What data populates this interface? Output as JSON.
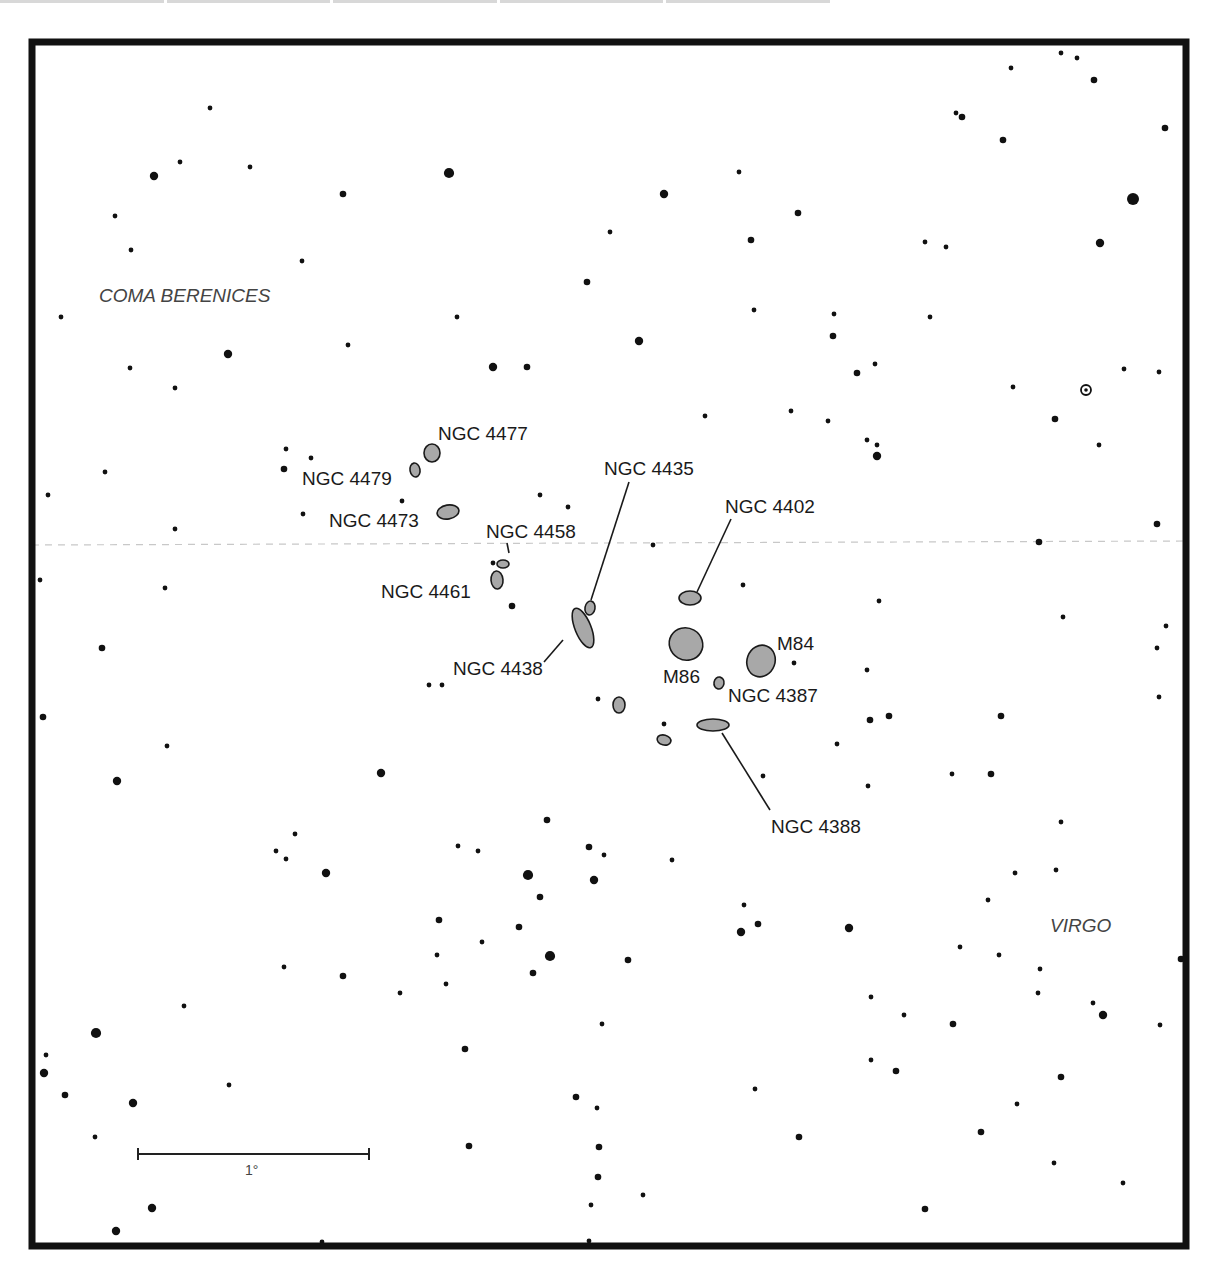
{
  "map": {
    "frame": {
      "x": 32,
      "y": 42,
      "w": 1154,
      "h": 1204,
      "stroke": 7,
      "color": "#111111"
    },
    "colors": {
      "galaxy_fill": "#a8a8a8",
      "galaxy_stroke": "#1a1a1a",
      "star": "#111111",
      "grid": "#c8c8c8"
    },
    "equator_line": {
      "y_left": 545,
      "y_right": 541
    },
    "constellations": [
      {
        "name": "COMA BERENICES",
        "x": 99,
        "y": 302
      },
      {
        "name": "VIRGO",
        "x": 1050,
        "y": 932
      }
    ],
    "galaxies": [
      {
        "id": "NGC 4477",
        "cx": 432,
        "cy": 453,
        "rx": 8,
        "ry": 9,
        "rot": 0,
        "label": "NGC 4477",
        "lx": 438,
        "ly": 440,
        "leader": null
      },
      {
        "id": "NGC 4479",
        "cx": 415,
        "cy": 470,
        "rx": 5,
        "ry": 7,
        "rot": -10,
        "label": "NGC 4479",
        "lx": 302,
        "ly": 485,
        "leader": null
      },
      {
        "id": "NGC 4473",
        "cx": 448,
        "cy": 512,
        "rx": 11,
        "ry": 7,
        "rot": -10,
        "label": "NGC 4473",
        "lx": 329,
        "ly": 527,
        "leader": null
      },
      {
        "id": "NGC 4458",
        "cx": 503,
        "cy": 564,
        "rx": 6,
        "ry": 4,
        "rot": 0,
        "label": "NGC 4458",
        "lx": 486,
        "ly": 538,
        "leader": [
          509,
          553,
          507,
          543
        ]
      },
      {
        "id": "NGC 4461",
        "cx": 497,
        "cy": 580,
        "rx": 6,
        "ry": 9,
        "rot": -5,
        "label": "NGC 4461",
        "lx": 381,
        "ly": 598,
        "leader": null
      },
      {
        "id": "NGC 4435",
        "cx": 590,
        "cy": 608,
        "rx": 5,
        "ry": 7,
        "rot": 10,
        "label": "NGC 4435",
        "lx": 604,
        "ly": 475,
        "leader": [
          591,
          600,
          629,
          482
        ]
      },
      {
        "id": "NGC 4438",
        "cx": 583,
        "cy": 628,
        "rx": 8,
        "ry": 21,
        "rot": -22,
        "label": "NGC 4438",
        "lx": 453,
        "ly": 675,
        "leader": [
          563,
          640,
          544,
          662
        ]
      },
      {
        "id": "NGC 4402",
        "cx": 690,
        "cy": 598,
        "rx": 11,
        "ry": 7,
        "rot": 0,
        "label": "NGC 4402",
        "lx": 725,
        "ly": 513,
        "leader": [
          697,
          592,
          731,
          519
        ]
      },
      {
        "id": "M86",
        "cx": 686,
        "cy": 644,
        "rx": 17,
        "ry": 16,
        "rot": 30,
        "label": "M86",
        "lx": 663,
        "ly": 683,
        "leader": null
      },
      {
        "id": "M84",
        "cx": 761,
        "cy": 661,
        "rx": 14,
        "ry": 16,
        "rot": 20,
        "label": "M84",
        "lx": 777,
        "ly": 650,
        "leader": null
      },
      {
        "id": "NGC 4387",
        "cx": 719,
        "cy": 683,
        "rx": 5,
        "ry": 6,
        "rot": 10,
        "label": "NGC 4387",
        "lx": 728,
        "ly": 702,
        "leader": null
      },
      {
        "id": "unlabeled-1",
        "cx": 619,
        "cy": 705,
        "rx": 6,
        "ry": 8,
        "rot": 0,
        "label": "",
        "lx": 0,
        "ly": 0,
        "leader": null
      },
      {
        "id": "NGC 4388",
        "cx": 713,
        "cy": 725,
        "rx": 16,
        "ry": 6,
        "rot": 0,
        "label": "NGC 4388",
        "lx": 771,
        "ly": 833,
        "leader": [
          722,
          733,
          770,
          810
        ]
      },
      {
        "id": "unlabeled-2",
        "cx": 664,
        "cy": 740,
        "rx": 7,
        "ry": 5,
        "rot": 15,
        "label": "",
        "lx": 0,
        "ly": 0,
        "leader": null
      }
    ],
    "variable_star": {
      "cx": 1086,
      "cy": 390
    },
    "scale_bar": {
      "x1": 138,
      "x2": 369,
      "y": 1154,
      "label": "1°",
      "lx": 245,
      "ly": 1175
    },
    "stars": [
      [
        210,
        108,
        2
      ],
      [
        154,
        176,
        4
      ],
      [
        180,
        162,
        2
      ],
      [
        250,
        167,
        2
      ],
      [
        343,
        194,
        3
      ],
      [
        449,
        173,
        5
      ],
      [
        115,
        216,
        2
      ],
      [
        131,
        250,
        2
      ],
      [
        302,
        261,
        2
      ],
      [
        1011,
        68,
        2
      ],
      [
        1061,
        53,
        2
      ],
      [
        1077,
        58,
        2
      ],
      [
        1094,
        80,
        3
      ],
      [
        956,
        113,
        2
      ],
      [
        962,
        117,
        3
      ],
      [
        1003,
        140,
        3
      ],
      [
        1165,
        128,
        3
      ],
      [
        1133,
        199,
        6
      ],
      [
        1100,
        243,
        4
      ],
      [
        925,
        242,
        2
      ],
      [
        946,
        247,
        2
      ],
      [
        739,
        172,
        2
      ],
      [
        664,
        194,
        4
      ],
      [
        798,
        213,
        3
      ],
      [
        610,
        232,
        2
      ],
      [
        751,
        240,
        3
      ],
      [
        587,
        282,
        3
      ],
      [
        639,
        341,
        4
      ],
      [
        754,
        310,
        2
      ],
      [
        834,
        314,
        2
      ],
      [
        833,
        336,
        3
      ],
      [
        930,
        317,
        2
      ],
      [
        493,
        367,
        4
      ],
      [
        527,
        367,
        3
      ],
      [
        457,
        317,
        2
      ],
      [
        348,
        345,
        2
      ],
      [
        228,
        354,
        4
      ],
      [
        130,
        368,
        2
      ],
      [
        175,
        388,
        2
      ],
      [
        61,
        317,
        2
      ],
      [
        857,
        373,
        3
      ],
      [
        875,
        364,
        2
      ],
      [
        1013,
        387,
        2
      ],
      [
        1124,
        369,
        2
      ],
      [
        1159,
        372,
        2
      ],
      [
        1055,
        419,
        3
      ],
      [
        1099,
        445,
        2
      ],
      [
        705,
        416,
        2
      ],
      [
        791,
        411,
        2
      ],
      [
        828,
        421,
        2
      ],
      [
        867,
        440,
        2
      ],
      [
        877,
        445,
        2
      ],
      [
        877,
        456,
        4
      ],
      [
        286,
        449,
        2
      ],
      [
        311,
        458,
        2
      ],
      [
        284,
        469,
        3
      ],
      [
        105,
        472,
        2
      ],
      [
        48,
        495,
        2
      ],
      [
        402,
        501,
        2
      ],
      [
        303,
        514,
        2
      ],
      [
        175,
        529,
        2
      ],
      [
        540,
        495,
        2
      ],
      [
        568,
        507,
        2
      ],
      [
        653,
        545,
        2
      ],
      [
        1039,
        542,
        3
      ],
      [
        1157,
        524,
        3
      ],
      [
        40,
        580,
        2
      ],
      [
        165,
        588,
        2
      ],
      [
        493,
        563,
        2
      ],
      [
        512,
        606,
        3
      ],
      [
        743,
        585,
        2
      ],
      [
        879,
        601,
        2
      ],
      [
        1063,
        617,
        2
      ],
      [
        1166,
        626,
        2
      ],
      [
        1157,
        648,
        2
      ],
      [
        102,
        648,
        3
      ],
      [
        429,
        685,
        2
      ],
      [
        442,
        685,
        2
      ],
      [
        598,
        699,
        2
      ],
      [
        664,
        724,
        2
      ],
      [
        794,
        663,
        2
      ],
      [
        867,
        670,
        2
      ],
      [
        870,
        720,
        3
      ],
      [
        889,
        716,
        3
      ],
      [
        1001,
        716,
        3
      ],
      [
        1159,
        697,
        2
      ],
      [
        43,
        717,
        3
      ],
      [
        167,
        746,
        2
      ],
      [
        117,
        781,
        4
      ],
      [
        381,
        773,
        4
      ],
      [
        295,
        834,
        2
      ],
      [
        276,
        851,
        2
      ],
      [
        286,
        859,
        2
      ],
      [
        326,
        873,
        4
      ],
      [
        458,
        846,
        2
      ],
      [
        478,
        851,
        2
      ],
      [
        589,
        847,
        3
      ],
      [
        604,
        855,
        2
      ],
      [
        672,
        860,
        2
      ],
      [
        528,
        875,
        5
      ],
      [
        547,
        820,
        3
      ],
      [
        594,
        880,
        4
      ],
      [
        540,
        897,
        3
      ],
      [
        763,
        776,
        2
      ],
      [
        837,
        744,
        2
      ],
      [
        868,
        786,
        2
      ],
      [
        952,
        774,
        2
      ],
      [
        991,
        774,
        3
      ],
      [
        1061,
        822,
        2
      ],
      [
        1056,
        870,
        2
      ],
      [
        439,
        920,
        3
      ],
      [
        482,
        942,
        2
      ],
      [
        519,
        927,
        3
      ],
      [
        550,
        956,
        5
      ],
      [
        437,
        955,
        2
      ],
      [
        533,
        973,
        3
      ],
      [
        446,
        984,
        2
      ],
      [
        628,
        960,
        3
      ],
      [
        284,
        967,
        2
      ],
      [
        343,
        976,
        3
      ],
      [
        400,
        993,
        2
      ],
      [
        744,
        905,
        2
      ],
      [
        758,
        924,
        3
      ],
      [
        741,
        932,
        4
      ],
      [
        849,
        928,
        4
      ],
      [
        988,
        900,
        2
      ],
      [
        1015,
        873,
        2
      ],
      [
        960,
        947,
        2
      ],
      [
        999,
        955,
        2
      ],
      [
        1040,
        969,
        2
      ],
      [
        1038,
        993,
        2
      ],
      [
        1093,
        1003,
        2
      ],
      [
        1103,
        1015,
        4
      ],
      [
        1181,
        959,
        3
      ],
      [
        96,
        1033,
        5
      ],
      [
        184,
        1006,
        2
      ],
      [
        46,
        1055,
        2
      ],
      [
        44,
        1073,
        4
      ],
      [
        465,
        1049,
        3
      ],
      [
        602,
        1024,
        2
      ],
      [
        871,
        997,
        2
      ],
      [
        871,
        1060,
        2
      ],
      [
        904,
        1015,
        2
      ],
      [
        953,
        1024,
        3
      ],
      [
        896,
        1071,
        3
      ],
      [
        1061,
        1077,
        3
      ],
      [
        1160,
        1025,
        2
      ],
      [
        65,
        1095,
        3
      ],
      [
        133,
        1103,
        4
      ],
      [
        229,
        1085,
        2
      ],
      [
        576,
        1097,
        3
      ],
      [
        597,
        1108,
        2
      ],
      [
        755,
        1089,
        2
      ],
      [
        1017,
        1104,
        2
      ],
      [
        95,
        1137,
        2
      ],
      [
        469,
        1146,
        3
      ],
      [
        599,
        1147,
        3
      ],
      [
        799,
        1137,
        3
      ],
      [
        981,
        1132,
        3
      ],
      [
        1054,
        1163,
        2
      ],
      [
        1123,
        1183,
        2
      ],
      [
        598,
        1177,
        3
      ],
      [
        643,
        1195,
        2
      ],
      [
        591,
        1205,
        2
      ],
      [
        152,
        1208,
        4
      ],
      [
        116,
        1231,
        4
      ],
      [
        925,
        1209,
        3
      ],
      [
        322,
        1242,
        2
      ],
      [
        589,
        1241,
        2
      ]
    ]
  }
}
